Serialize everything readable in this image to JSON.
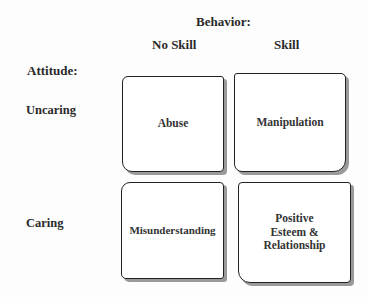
{
  "header": {
    "behavior_label": "Behavior:",
    "columns": [
      "No Skill",
      "Skill"
    ]
  },
  "attitude": {
    "label": "Attitude:",
    "rows": [
      "Uncaring",
      "Caring"
    ]
  },
  "cells": {
    "uncaring_no_skill": "Abuse",
    "uncaring_skill": "Manipulation",
    "caring_no_skill": "Misunderstanding",
    "caring_skill": [
      "Positive",
      "Esteem &",
      "Relationship"
    ]
  }
}
